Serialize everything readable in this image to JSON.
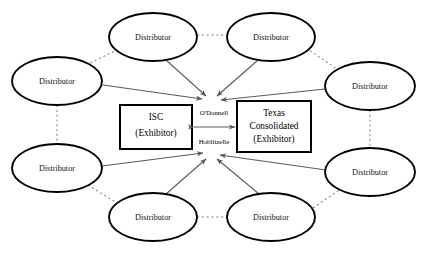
{
  "diagram": {
    "type": "network-diagram",
    "background_color": "#ffffff",
    "node_stroke_color": "#000000",
    "solid_edge_color": "#5a5a5a",
    "dotted_edge_color": "#8a8a8a",
    "distributors": [
      {
        "id": "dist-top-left",
        "label": "Distributor",
        "cx": 153,
        "cy": 37,
        "rx": 44,
        "ry": 24
      },
      {
        "id": "dist-top-right",
        "label": "Distributor",
        "cx": 271,
        "cy": 37,
        "rx": 44,
        "ry": 24
      },
      {
        "id": "dist-left-upper",
        "label": "Distributor",
        "cx": 57,
        "cy": 81,
        "rx": 45,
        "ry": 24
      },
      {
        "id": "dist-right-upper",
        "label": "Distributor",
        "cx": 370,
        "cy": 86,
        "rx": 45,
        "ry": 24
      },
      {
        "id": "dist-left-lower",
        "label": "Distributor",
        "cx": 57,
        "cy": 168,
        "rx": 45,
        "ry": 24
      },
      {
        "id": "dist-right-lower",
        "label": "Distributor",
        "cx": 370,
        "cy": 172,
        "rx": 45,
        "ry": 24
      },
      {
        "id": "dist-bottom-left",
        "label": "Distributor",
        "cx": 153,
        "cy": 217,
        "rx": 44,
        "ry": 24
      },
      {
        "id": "dist-bottom-right",
        "label": "Distributor",
        "cx": 271,
        "cy": 217,
        "rx": 44,
        "ry": 24
      }
    ],
    "exhibitors": [
      {
        "id": "box-isc",
        "lines": [
          "ISC",
          "(Exhibitor)"
        ],
        "x": 120,
        "y": 105,
        "width": 72,
        "height": 44
      },
      {
        "id": "box-texas-consolidated",
        "lines": [
          "Texas",
          "Consolidated",
          "(Exhibitor)"
        ],
        "x": 237,
        "y": 101,
        "width": 74,
        "height": 51
      }
    ],
    "link_labels": [
      {
        "id": "label-odonnell",
        "text": "O'Donnell",
        "x": 214,
        "y": 113
      },
      {
        "id": "label-hoblitzelle",
        "text": "Hoblitzelle",
        "x": 214,
        "y": 142
      }
    ],
    "hubs": [
      {
        "id": "hub-upper",
        "x": 211,
        "y": 100
      },
      {
        "id": "hub-lower",
        "x": 211,
        "y": 155
      }
    ]
  }
}
